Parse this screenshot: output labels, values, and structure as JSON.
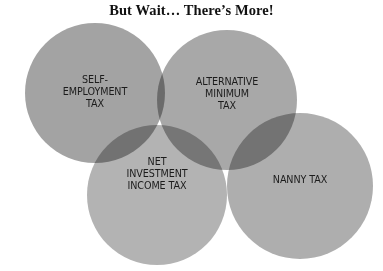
{
  "title": "But Wait… There’s More!",
  "circles": [
    {
      "id": "self-employment",
      "label": "SELF-\nEMPLOYMENT\nTAX",
      "cx": 95,
      "cy": 93,
      "r": 70,
      "color": "#a3a3a3"
    },
    {
      "id": "amt",
      "label": "ALTERNATIVE\nMINIMUM\nTAX",
      "cx": 227,
      "cy": 100,
      "r": 70,
      "color": "#a8a8a8"
    },
    {
      "id": "net-investment",
      "label": "NET\nINVESTMENT\nINCOME TAX",
      "cx": 157,
      "cy": 195,
      "r": 70,
      "color": "#b3b3b3"
    },
    {
      "id": "nanny",
      "label": "NANNY TAX",
      "cx": 300,
      "cy": 186,
      "r": 73,
      "color": "#aeaeae"
    }
  ],
  "colors": {
    "background": "#ffffff",
    "title_text": "#111111",
    "label_text": "#1c1c1c"
  }
}
